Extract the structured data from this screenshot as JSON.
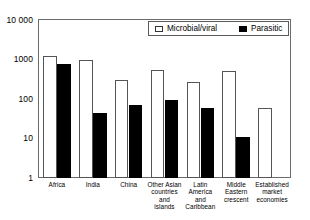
{
  "chart_data": {
    "type": "bar",
    "title": "",
    "xlabel": "",
    "ylabel": "",
    "yscale": "log",
    "ylim": [
      1,
      10000
    ],
    "ytick_labels": [
      "10 000",
      "1000",
      "100",
      "10",
      "1"
    ],
    "ytick_values": [
      10000,
      1000,
      100,
      10,
      1
    ],
    "grid": false,
    "legend_position": "top-right",
    "categories": [
      "Africa",
      "India",
      "China",
      "Other Asian\ncountries\nand\nislands",
      "Latin\nAmerica\nand\nCaribbean",
      "Middle\nEastern\ncrescent",
      "Established\nmarket\neconomies"
    ],
    "series": [
      {
        "name": "Microbial/viral",
        "color": "#ffffff",
        "edge_color": "#555555",
        "values": [
          1200,
          1000,
          300,
          550,
          270,
          500,
          60
        ]
      },
      {
        "name": "Parasitic",
        "color": "#000000",
        "edge_color": "#000000",
        "values": [
          780,
          43,
          70,
          95,
          58,
          11,
          null
        ]
      }
    ]
  },
  "legend": {
    "items": [
      {
        "label": "Microbial/viral",
        "swatch": "open-square-icon"
      },
      {
        "label": "Parasitic",
        "swatch": "filled-square-icon"
      }
    ]
  }
}
